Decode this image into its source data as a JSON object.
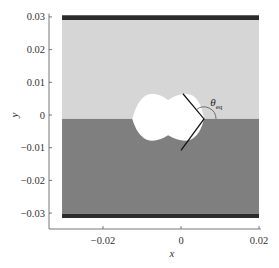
{
  "chart_data": {
    "type": "heatmap",
    "title": "",
    "xlabel": "x",
    "ylabel": "y",
    "xlim": [
      -0.0305,
      0.0205
    ],
    "ylim": [
      -0.0345,
      0.031
    ],
    "xticks": [
      -0.02,
      0,
      0.02
    ],
    "xtick_labels": [
      "−0.02",
      "0",
      "0.02"
    ],
    "yticks": [
      0.03,
      0.02,
      0.01,
      0,
      -0.01,
      -0.02,
      -0.03
    ],
    "ytick_labels": [
      "0.03",
      "0.02",
      "0.01",
      "0",
      "−0.01",
      "−0.02",
      "−0.03"
    ],
    "grid": false,
    "domain": {
      "x": [
        -0.0305,
        0.02
      ],
      "y": [
        -0.0315,
        0.0305
      ]
    },
    "regions": [
      {
        "name": "top-wall",
        "y": [
          0.029,
          0.0305
        ],
        "color": "#2b2b2b"
      },
      {
        "name": "upper-phase",
        "y": [
          -0.0012,
          0.029
        ],
        "color": "#d6d6d6"
      },
      {
        "name": "lower-phase",
        "y": [
          -0.0302,
          -0.0012
        ],
        "color": "#7f7f7f"
      },
      {
        "name": "bottom-wall",
        "y": [
          -0.0315,
          -0.0302
        ],
        "color": "#2b2b2b"
      }
    ],
    "interface_y": -0.0012,
    "droplet": {
      "x_left": -0.0125,
      "x_right": 0.0059,
      "y_top": 0.0046,
      "y_bottom": -0.0062,
      "color": "#ffffff"
    },
    "tangent_line": {
      "points": [
        [
          0.0005,
          0.0065
        ],
        [
          0.0059,
          -0.0012
        ],
        [
          0.0,
          -0.0108
        ]
      ]
    },
    "annotations": [
      {
        "text": "θ",
        "subscript": "eq",
        "x": 0.0075,
        "y": 0.0028
      }
    ]
  }
}
